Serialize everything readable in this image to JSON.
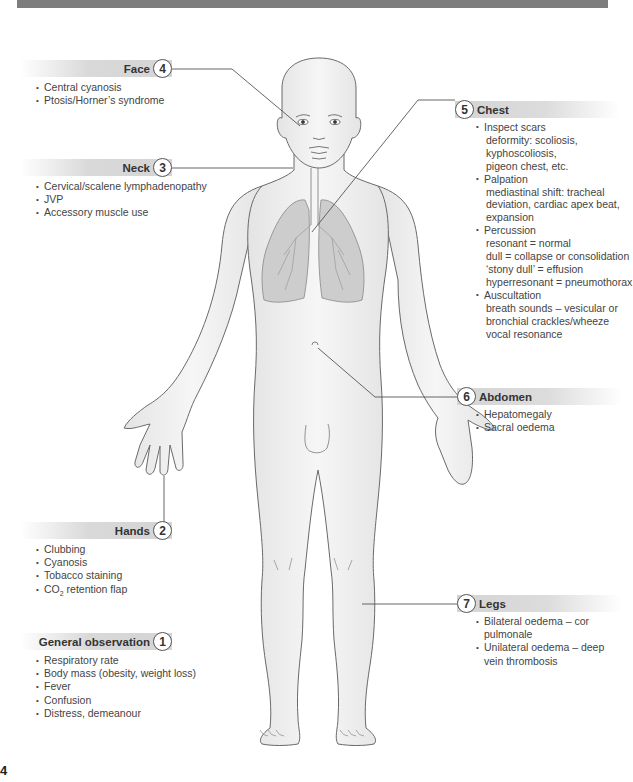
{
  "page": {
    "number": "4"
  },
  "sections": {
    "face": {
      "number": "4",
      "title": "Face",
      "items": [
        "Central cyanosis",
        "Ptosis/Horner’s syndrome"
      ]
    },
    "neck": {
      "number": "3",
      "title": "Neck",
      "items": [
        "Cervical/scalene lymphadenopathy",
        "JVP",
        "Accessory muscle use"
      ]
    },
    "chest": {
      "number": "5",
      "title": "Chest",
      "items": [
        {
          "label": "Inspect scars",
          "details": [
            "deformity: scoliosis,",
            "kyphoscoliosis,",
            "pigeon chest, etc."
          ]
        },
        {
          "label": "Palpation",
          "details": [
            "mediastinal shift: tracheal",
            "deviation, cardiac apex beat,",
            "expansion"
          ]
        },
        {
          "label": "Percussion",
          "details": [
            "resonant = normal",
            "dull = collapse or consolidation",
            "‘stony dull’ = effusion",
            "hyperresonant = pneumothorax"
          ]
        },
        {
          "label": "Auscultation",
          "details": [
            "breath sounds – vesicular or",
            "bronchial crackles/wheeze",
            "vocal resonance"
          ]
        }
      ]
    },
    "abdomen": {
      "number": "6",
      "title": "Abdomen",
      "items": [
        "Hepatomegaly",
        "Sacral oedema"
      ]
    },
    "hands": {
      "number": "2",
      "title": "Hands",
      "items": [
        "Clubbing",
        "Cyanosis",
        "Tobacco staining",
        "CO",
        "2",
        " retention flap"
      ]
    },
    "legs": {
      "number": "7",
      "title": "Legs",
      "items": [
        "Bilateral oedema – cor pulmonale",
        "Unilateral oedema – deep vein thrombosis"
      ]
    },
    "general": {
      "number": "1",
      "title": "General observation",
      "items": [
        "Respiratory rate",
        "Body mass (obesity, weight loss)",
        "Fever",
        "Confusion",
        "Distress, demeanour"
      ]
    }
  },
  "colors": {
    "topbar": "#7d7d7d",
    "label_bar": "#d6d6d6",
    "line": "#555555",
    "skin_outline": "#6a6a6a",
    "lung_fill": "#c8c8c8"
  }
}
